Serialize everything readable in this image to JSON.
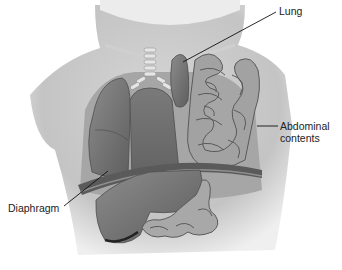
{
  "diagram": {
    "labels": {
      "lung": "Lung",
      "abdominal_line1": "Abdominal",
      "abdominal_line2": "contents",
      "diaphragm": "Diaphragm"
    },
    "colors": {
      "skin": "#dcdcdc",
      "skin_shadow": "#b9b9b9",
      "organ_dark": "#6f6f6f",
      "organ_mid": "#8a8a8a",
      "bowel": "#9b9b9b",
      "bowel_edge": "#5c5c5c",
      "leader_line": "#111111",
      "text": "#222222"
    }
  }
}
